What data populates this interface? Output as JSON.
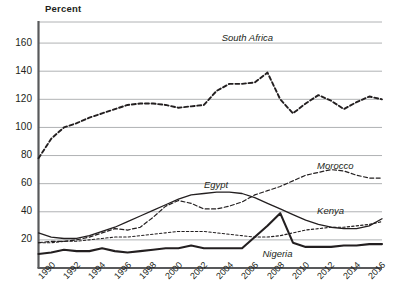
{
  "chart_data": {
    "type": "line",
    "title": "",
    "ylabel": "Percent",
    "xlabel": "",
    "ylim": [
      0,
      175
    ],
    "yticks": [
      20,
      40,
      60,
      80,
      100,
      120,
      140,
      160
    ],
    "xlim": [
      1990,
      2017
    ],
    "xticks": [
      1990,
      1992,
      1994,
      1996,
      1998,
      2000,
      2002,
      2004,
      2006,
      2008,
      2010,
      2012,
      2014,
      2016
    ],
    "grid": "horizontal",
    "legend_position": "inline-labels",
    "x": [
      1990,
      1991,
      1992,
      1993,
      1994,
      1995,
      1996,
      1997,
      1998,
      1999,
      2000,
      2001,
      2002,
      2003,
      2004,
      2005,
      2006,
      2007,
      2008,
      2009,
      2010,
      2011,
      2012,
      2013,
      2014,
      2015,
      2016,
      2017
    ],
    "series": [
      {
        "name": "South Africa",
        "style": "dashed-bold",
        "color": "#231f20",
        "label_x": 2004.4,
        "label_y": 163,
        "values": [
          78,
          92,
          100,
          103,
          107,
          110,
          113,
          116,
          117,
          117,
          116,
          114,
          115,
          116,
          126,
          131,
          131,
          132,
          139,
          120,
          110,
          117,
          123,
          119,
          113,
          118,
          122,
          120
        ]
      },
      {
        "name": "Morocco",
        "style": "dashed",
        "color": "#231f20",
        "label_x": 2011.9,
        "label_y": 72,
        "values": [
          18,
          19,
          19,
          20,
          22,
          25,
          28,
          27,
          29,
          36,
          44,
          48,
          46,
          42,
          42,
          44,
          47,
          52,
          55,
          58,
          62,
          66,
          68,
          70,
          69,
          66,
          64,
          64
        ]
      },
      {
        "name": "Egypt",
        "style": "solid-thin",
        "color": "#231f20",
        "label_x": 2003.0,
        "label_y": 58,
        "values": [
          25,
          22,
          21,
          21,
          23,
          26,
          29,
          33,
          37,
          41,
          45,
          49,
          52,
          53,
          54,
          54,
          53,
          50,
          46,
          42,
          38,
          34,
          31,
          29,
          28,
          28,
          30,
          35
        ]
      },
      {
        "name": "Kenya",
        "style": "dotted",
        "color": "#231f20",
        "label_x": 2011.9,
        "label_y": 40,
        "values": [
          18,
          18,
          19,
          19,
          20,
          21,
          22,
          22,
          23,
          24,
          25,
          26,
          26,
          26,
          25,
          24,
          23,
          22,
          22,
          23,
          25,
          27,
          28,
          29,
          29,
          30,
          31,
          33
        ]
      },
      {
        "name": "Nigeria",
        "style": "solid-bold",
        "color": "#231f20",
        "label_x": 2007.6,
        "label_y": 9,
        "values": [
          10,
          11,
          13,
          12,
          12,
          14,
          12,
          11,
          12,
          13,
          14,
          14,
          16,
          14,
          14,
          14,
          14,
          22,
          30,
          39,
          18,
          15,
          15,
          15,
          16,
          16,
          17,
          17
        ]
      }
    ]
  },
  "axis": {
    "y_title": "Percent"
  }
}
